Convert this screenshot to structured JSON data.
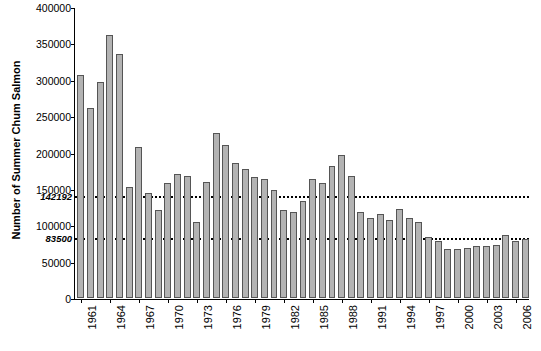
{
  "chart_data": {
    "type": "bar",
    "title": "",
    "xlabel": "",
    "ylabel": "Number of Summer Chum Salmon",
    "ylim": [
      0,
      400000
    ],
    "ytick_labels": [
      "0",
      "50000",
      "100000",
      "150000",
      "200000",
      "250000",
      "300000",
      "350000",
      "400000"
    ],
    "ytick_values": [
      0,
      50000,
      100000,
      150000,
      200000,
      250000,
      300000,
      350000,
      400000
    ],
    "grid": false,
    "legend": "none",
    "categories": [
      "1961",
      "1962",
      "1963",
      "1964",
      "1965",
      "1966",
      "1967",
      "1968",
      "1969",
      "1970",
      "1971",
      "1972",
      "1973",
      "1974",
      "1975",
      "1976",
      "1977",
      "1978",
      "1979",
      "1980",
      "1981",
      "1982",
      "1983",
      "1984",
      "1985",
      "1986",
      "1987",
      "1988",
      "1989",
      "1990",
      "1991",
      "1992",
      "1993",
      "1994",
      "1995",
      "1996",
      "1997",
      "1998",
      "1999",
      "2000",
      "2001",
      "2002",
      "2003",
      "2004",
      "2005",
      "2006",
      "2007"
    ],
    "xtick_labels": [
      "1961",
      "1964",
      "1967",
      "1970",
      "1973",
      "1976",
      "1979",
      "1982",
      "1985",
      "1988",
      "1991",
      "1994",
      "1997",
      "2000",
      "2003",
      "2006"
    ],
    "values": [
      306000,
      261000,
      297000,
      361000,
      336000,
      153000,
      207000,
      144000,
      121000,
      158000,
      171000,
      168000,
      105000,
      160000,
      227000,
      211000,
      185000,
      178000,
      166000,
      163000,
      148000,
      121000,
      118000,
      134000,
      163000,
      158000,
      181000,
      197000,
      168000,
      118000,
      110000,
      116000,
      107000,
      122000,
      110000,
      104000,
      84000,
      79000,
      67000,
      67000,
      69000,
      71000,
      71000,
      73000,
      86000,
      79000,
      81000
    ],
    "reference_lines": [
      {
        "label": "142192",
        "value": 142192
      },
      {
        "label": "83500",
        "value": 83500
      }
    ]
  }
}
